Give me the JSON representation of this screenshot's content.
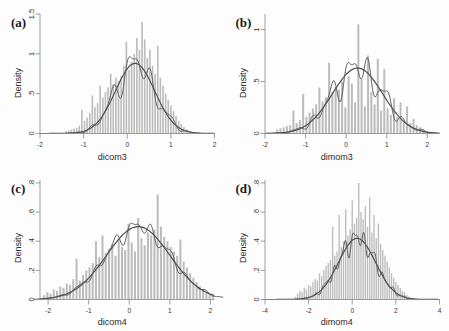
{
  "figure": {
    "background": "#fdfdfd",
    "bar_color": "#bcbcbc",
    "curve_color": "#4a4a4a",
    "axis_color": "#8d8d8d",
    "ylabel": "Density"
  },
  "panels": [
    {
      "letter": "(a)",
      "xlabel": "dicom3",
      "ylabel": "Density",
      "xticks": [
        "-2",
        "-1",
        "0",
        "1",
        "2"
      ],
      "yticks": [
        "0",
        ".5",
        "1",
        "1.5"
      ]
    },
    {
      "letter": "(b)",
      "xlabel": "dimom3",
      "ylabel": "Density",
      "xticks": [
        "-2",
        "-1",
        "0",
        "1",
        "2"
      ],
      "yticks": [
        "0",
        ".5",
        "1"
      ]
    },
    {
      "letter": "(c)",
      "xlabel": "dicom4",
      "ylabel": "Density",
      "xticks": [
        "-2",
        "-1",
        "0",
        "1",
        "2"
      ],
      "yticks": [
        "0",
        ".2",
        ".4",
        ".6",
        ".8"
      ]
    },
    {
      "letter": "(d)",
      "xlabel": "dimom4",
      "ylabel": "Density",
      "xticks": [
        "-4",
        "-2",
        "0",
        "2",
        "4"
      ],
      "yticks": [
        "0",
        ".2",
        ".4",
        ".6",
        ".8"
      ]
    }
  ],
  "chart_data": [
    {
      "type": "bar",
      "panel": "(a)",
      "title": "",
      "xlabel": "dicom3",
      "ylabel": "Density",
      "xlim": [
        -2,
        2
      ],
      "ylim": [
        0,
        1.5
      ],
      "xticks": [
        -2,
        -1,
        0,
        1,
        2
      ],
      "yticks": [
        0,
        0.5,
        1,
        1.5
      ],
      "grid": false,
      "legend": "none",
      "histogram": {
        "bin_centers": [
          -1.4,
          -1.34,
          -1.28,
          -1.22,
          -1.16,
          -1.1,
          -1.04,
          -0.98,
          -0.92,
          -0.86,
          -0.8,
          -0.74,
          -0.68,
          -0.62,
          -0.56,
          -0.5,
          -0.44,
          -0.38,
          -0.32,
          -0.26,
          -0.2,
          -0.14,
          -0.08,
          -0.02,
          0.04,
          0.1,
          0.16,
          0.22,
          0.28,
          0.34,
          0.4,
          0.46,
          0.52,
          0.58,
          0.64,
          0.7,
          0.76,
          0.82,
          0.88,
          0.94,
          1.0,
          1.06,
          1.12,
          1.18,
          1.24,
          1.3,
          1.36,
          1.42
        ],
        "densities": [
          0.03,
          0.04,
          0.05,
          0.06,
          0.07,
          0.1,
          0.3,
          0.16,
          0.2,
          0.26,
          0.48,
          0.33,
          0.38,
          0.6,
          0.45,
          0.52,
          0.58,
          0.75,
          0.62,
          0.7,
          0.66,
          0.72,
          0.85,
          1.15,
          0.8,
          0.9,
          1.0,
          1.2,
          1.05,
          1.4,
          1.18,
          0.95,
          1.05,
          0.85,
          0.75,
          1.1,
          0.7,
          0.6,
          0.5,
          0.42,
          0.35,
          0.28,
          0.22,
          0.16,
          0.12,
          0.08,
          0.05,
          0.02
        ]
      },
      "normal_curve": {
        "mean": 0.18,
        "sd": 0.45,
        "peak": 0.88
      },
      "kde_curve_peak": 1.15
    },
    {
      "type": "bar",
      "panel": "(b)",
      "title": "",
      "xlabel": "dimom3",
      "ylabel": "Density",
      "xlim": [
        -2,
        2.3
      ],
      "ylim": [
        0,
        1.15
      ],
      "xticks": [
        -2,
        -1,
        0,
        1,
        2
      ],
      "yticks": [
        0,
        0.5,
        1
      ],
      "grid": false,
      "legend": "none",
      "histogram": {
        "bin_centers": [
          -1.7,
          -1.62,
          -1.54,
          -1.46,
          -1.38,
          -1.3,
          -1.22,
          -1.14,
          -1.06,
          -0.98,
          -0.9,
          -0.82,
          -0.74,
          -0.66,
          -0.58,
          -0.5,
          -0.42,
          -0.34,
          -0.26,
          -0.18,
          -0.1,
          -0.02,
          0.06,
          0.14,
          0.22,
          0.3,
          0.38,
          0.46,
          0.54,
          0.62,
          0.7,
          0.78,
          0.86,
          0.94,
          1.02,
          1.1,
          1.18,
          1.26,
          1.34,
          1.42,
          1.5,
          1.58,
          1.66,
          1.74,
          1.82,
          1.9,
          1.98
        ],
        "densities": [
          0.04,
          0.05,
          0.06,
          0.07,
          0.08,
          0.22,
          0.1,
          0.13,
          0.38,
          0.16,
          0.2,
          0.24,
          0.28,
          0.44,
          0.31,
          0.35,
          0.68,
          0.4,
          0.45,
          0.42,
          0.5,
          0.25,
          0.55,
          0.48,
          0.3,
          1.05,
          0.52,
          0.26,
          0.75,
          0.4,
          0.28,
          0.72,
          0.22,
          0.62,
          0.24,
          0.18,
          0.34,
          0.16,
          0.3,
          0.12,
          0.26,
          0.1,
          0.14,
          0.08,
          0.06,
          0.04,
          0.02
        ]
      },
      "normal_curve": {
        "mean": 0.28,
        "sd": 0.62,
        "peak": 0.63
      },
      "kde_curve_peak": 0.85
    },
    {
      "type": "bar",
      "panel": "(c)",
      "title": "",
      "xlabel": "dicom4",
      "ylabel": "Density",
      "xlim": [
        -2.2,
        2.1
      ],
      "ylim": [
        0,
        0.82
      ],
      "xticks": [
        -2,
        -1,
        0,
        1,
        2
      ],
      "yticks": [
        0,
        0.2,
        0.4,
        0.6,
        0.8
      ],
      "grid": false,
      "legend": "none",
      "histogram": {
        "bin_centers": [
          -2.1,
          -2.02,
          -1.94,
          -1.86,
          -1.78,
          -1.7,
          -1.62,
          -1.54,
          -1.46,
          -1.38,
          -1.3,
          -1.22,
          -1.14,
          -1.06,
          -0.98,
          -0.9,
          -0.82,
          -0.74,
          -0.66,
          -0.58,
          -0.5,
          -0.42,
          -0.34,
          -0.26,
          -0.18,
          -0.1,
          -0.02,
          0.06,
          0.14,
          0.22,
          0.3,
          0.38,
          0.46,
          0.54,
          0.62,
          0.7,
          0.78,
          0.86,
          0.94,
          1.02,
          1.1,
          1.18,
          1.26,
          1.34,
          1.42,
          1.5,
          1.58,
          1.66,
          1.74,
          1.82,
          1.9,
          1.98,
          2.06
        ],
        "densities": [
          0.03,
          0.05,
          0.04,
          0.07,
          0.06,
          0.09,
          0.08,
          0.11,
          0.1,
          0.14,
          0.28,
          0.13,
          0.17,
          0.2,
          0.22,
          0.25,
          0.4,
          0.29,
          0.44,
          0.32,
          0.35,
          0.38,
          0.3,
          0.41,
          0.36,
          0.34,
          0.52,
          0.39,
          0.33,
          0.56,
          0.42,
          0.37,
          0.46,
          0.44,
          0.48,
          0.72,
          0.5,
          0.43,
          0.4,
          0.36,
          0.33,
          0.3,
          0.41,
          0.26,
          0.22,
          0.18,
          0.15,
          0.12,
          0.09,
          0.07,
          0.05,
          0.04,
          0.02
        ]
      },
      "normal_curve": {
        "mean": 0.22,
        "sd": 0.78,
        "peak": 0.5
      },
      "kde_curve_peak": 0.58
    },
    {
      "type": "bar",
      "panel": "(d)",
      "title": "",
      "xlabel": "dimom4",
      "ylabel": "Density",
      "xlim": [
        -4,
        4
      ],
      "ylim": [
        0,
        0.82
      ],
      "xticks": [
        -4,
        -2,
        0,
        2,
        4
      ],
      "yticks": [
        0,
        0.2,
        0.4,
        0.6,
        0.8
      ],
      "grid": false,
      "legend": "none",
      "histogram": {
        "bin_centers": [
          -2.6,
          -2.5,
          -2.4,
          -2.3,
          -2.2,
          -2.1,
          -2.0,
          -1.9,
          -1.8,
          -1.7,
          -1.6,
          -1.5,
          -1.4,
          -1.3,
          -1.2,
          -1.1,
          -1.0,
          -0.9,
          -0.8,
          -0.7,
          -0.6,
          -0.5,
          -0.4,
          -0.3,
          -0.2,
          -0.1,
          0.0,
          0.1,
          0.2,
          0.3,
          0.4,
          0.5,
          0.6,
          0.7,
          0.8,
          0.9,
          1.0,
          1.1,
          1.2,
          1.3,
          1.4,
          1.5,
          1.6,
          1.7,
          1.8,
          1.9,
          2.0,
          2.1,
          2.2,
          2.3,
          2.4,
          2.5,
          2.6
        ],
        "densities": [
          0.02,
          0.04,
          0.06,
          0.05,
          0.08,
          0.07,
          0.1,
          0.09,
          0.12,
          0.14,
          0.13,
          0.18,
          0.16,
          0.2,
          0.23,
          0.25,
          0.27,
          0.5,
          0.3,
          0.33,
          0.58,
          0.36,
          0.4,
          0.62,
          0.44,
          0.48,
          0.68,
          0.52,
          0.56,
          0.8,
          0.6,
          0.55,
          0.64,
          0.5,
          0.7,
          0.46,
          0.58,
          0.42,
          0.52,
          0.38,
          0.34,
          0.3,
          0.26,
          0.22,
          0.18,
          0.15,
          0.12,
          0.1,
          0.08,
          0.06,
          0.05,
          0.03,
          0.02
        ]
      },
      "normal_curve": {
        "mean": 0.22,
        "sd": 0.85,
        "peak": 0.42
      },
      "kde_curve_peak": 0.52
    }
  ]
}
